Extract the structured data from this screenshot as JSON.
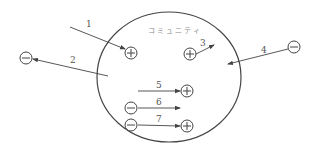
{
  "diagram": {
    "title": "コミュニティ",
    "colors": {
      "line": "#444444",
      "label": "#555555",
      "title": "#888888",
      "background": "#ffffff"
    },
    "community_circle": {
      "cx": 169,
      "cy": 77,
      "rx": 72,
      "ry": 65
    },
    "nodes": [
      {
        "id": "p1",
        "sign": "+",
        "x": 131,
        "y": 53
      },
      {
        "id": "p3",
        "sign": "+",
        "x": 190,
        "y": 54
      },
      {
        "id": "p5",
        "sign": "+",
        "x": 187,
        "y": 91
      },
      {
        "id": "p7",
        "sign": "+",
        "x": 187,
        "y": 126
      },
      {
        "id": "m2",
        "sign": "-",
        "x": 26,
        "y": 58
      },
      {
        "id": "m4",
        "sign": "-",
        "x": 294,
        "y": 47
      },
      {
        "id": "m6",
        "sign": "-",
        "x": 131,
        "y": 108
      },
      {
        "id": "m7",
        "sign": "-",
        "x": 131,
        "y": 125
      }
    ],
    "arrows": [
      {
        "label": "1",
        "x1": 70,
        "y1": 27,
        "x2": 125,
        "y2": 49,
        "lx": 86,
        "ly": 27
      },
      {
        "label": "2",
        "x1": 108,
        "y1": 76,
        "x2": 33,
        "y2": 59,
        "lx": 70,
        "ly": 63
      },
      {
        "label": "3",
        "x1": 196,
        "y1": 54,
        "x2": 214,
        "y2": 45,
        "lx": 200,
        "ly": 46
      },
      {
        "label": "4",
        "x1": 288,
        "y1": 49,
        "x2": 228,
        "y2": 64,
        "lx": 261,
        "ly": 53
      },
      {
        "label": "5",
        "x1": 138,
        "y1": 91,
        "x2": 180,
        "y2": 91,
        "lx": 156,
        "ly": 88
      },
      {
        "label": "6",
        "x1": 138,
        "y1": 108,
        "x2": 180,
        "y2": 108,
        "lx": 156,
        "ly": 105
      },
      {
        "label": "7",
        "x1": 138,
        "y1": 125,
        "x2": 180,
        "y2": 126,
        "lx": 156,
        "ly": 122
      }
    ]
  }
}
